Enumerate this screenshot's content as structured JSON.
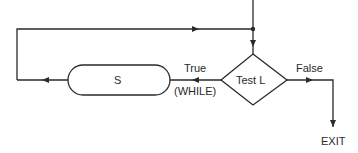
{
  "diagram": {
    "nodes": {
      "process": {
        "label": "S",
        "shape": "rounded-rectangle"
      },
      "decision": {
        "label": "Test L",
        "shape": "diamond"
      },
      "exit": {
        "label": "EXIT",
        "shape": "terminal-text"
      }
    },
    "edges": {
      "true_label": "True",
      "while_label": "(WHILE)",
      "false_label": "False"
    },
    "colors": {
      "stroke": "#2a2a2a",
      "background": "#ffffff"
    }
  }
}
